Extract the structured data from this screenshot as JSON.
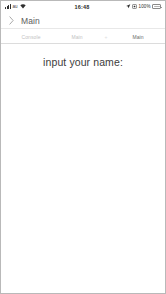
{
  "status_bar": {
    "carrier": "au",
    "signal_icon": "signal-bars-icon",
    "wifi_icon": "wifi-icon",
    "time": "16:48",
    "location_icon": "location-arrow-icon",
    "orientation_lock_icon": "screen-lock-icon",
    "battery_percent": "100%",
    "battery_icon": "battery-icon"
  },
  "nav_bar": {
    "back_icon": "chevron-right-icon",
    "title": "Main"
  },
  "tab_bar": {
    "tabs": [
      {
        "label": "Console",
        "active": false
      },
      {
        "label": "Main",
        "active": false
      },
      {
        "label": "Main",
        "active": true
      }
    ],
    "separator": "+"
  },
  "content": {
    "heading": "input your name:"
  },
  "colors": {
    "background": "#ffffff",
    "frame_border": "#b9b9b9",
    "divider": "#e8e8e8",
    "heading_text": "#3c3c3c",
    "nav_title_text": "#5c5c5c",
    "tab_inactive_text": "#c2c2c2",
    "tab_active_text": "#6b6b6b",
    "status_text": "#2e2e2e"
  }
}
